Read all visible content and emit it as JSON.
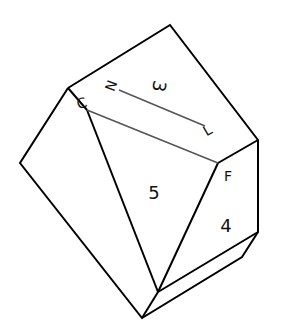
{
  "diagram": {
    "type": "crystal-polyhedron-line-drawing",
    "face_labels": [
      {
        "id": "face-3",
        "text": "3",
        "x": 158,
        "y": 86,
        "rotate": 100,
        "size": 18
      },
      {
        "id": "face-5",
        "text": "5",
        "x": 154,
        "y": 194,
        "rotate": 0,
        "size": 18
      },
      {
        "id": "face-4",
        "text": "4",
        "x": 226,
        "y": 227,
        "rotate": 0,
        "size": 18
      }
    ],
    "point_labels": [
      {
        "id": "point-C",
        "text": "C",
        "x": 82,
        "y": 104,
        "rotate": -20,
        "size": 14
      },
      {
        "id": "point-N",
        "text": "N",
        "x": 112,
        "y": 86,
        "rotate": -70,
        "size": 14
      },
      {
        "id": "point-L",
        "text": "L",
        "x": 208,
        "y": 131,
        "rotate": -30,
        "size": 14
      },
      {
        "id": "point-F",
        "text": "F",
        "x": 228,
        "y": 177,
        "rotate": 0,
        "size": 14
      }
    ],
    "colors": {
      "edge": "#000000",
      "inner_line": "#555555",
      "background": "#ffffff"
    }
  }
}
